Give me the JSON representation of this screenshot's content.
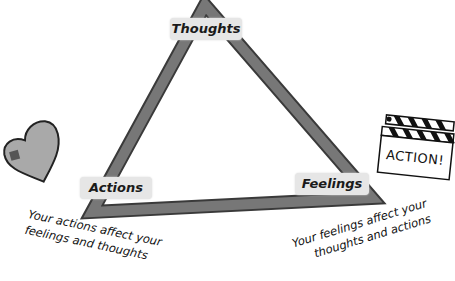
{
  "diagram": {
    "type": "cycle-triangle",
    "nodes": [
      {
        "id": "thoughts",
        "label": "Thoughts"
      },
      {
        "id": "actions",
        "label": "Actions"
      },
      {
        "id": "feelings",
        "label": "Feelings"
      }
    ],
    "captions": {
      "actions": [
        "Your actions affect your",
        "feelings and thoughts"
      ],
      "feelings": [
        "Your feelings affect your",
        "thoughts and actions"
      ]
    },
    "illustrations": {
      "heart": {
        "icon": "heart-icon"
      },
      "clapperboard": {
        "icon": "clapperboard-icon",
        "text": "ACTION!"
      }
    },
    "colors": {
      "triangle": "#6e6e6e",
      "triangle_outline": "#3a3a3a",
      "label_bg": "#e6e6e6",
      "heart_fill": "#a9a9a9"
    }
  }
}
